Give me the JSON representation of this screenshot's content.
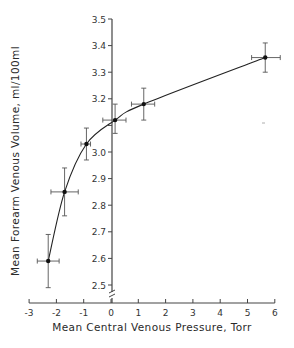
{
  "chart_data": {
    "type": "line",
    "title": "",
    "xlabel": "Mean Central Venous Pressure, Torr",
    "ylabel": "Mean Forearm Venous Volume, ml/100ml",
    "xlim": [
      -3,
      6
    ],
    "ylim": [
      2.45,
      3.5
    ],
    "x_ticks": [
      "-3",
      "-2",
      "-1",
      "0",
      "1",
      "2",
      "3",
      "4",
      "5",
      "6"
    ],
    "y_ticks": [
      "2.5",
      "2.6",
      "2.7",
      "2.8",
      "2.9",
      "3.0",
      "3.1",
      "3.2",
      "3.3",
      "3.4",
      "3.5"
    ],
    "y_tick_labels_shown": [
      "2.5",
      "2.6",
      "2.7",
      "2.8",
      "2.9",
      "3.0",
      "3.2",
      "3.3",
      "3.4",
      "3.5"
    ],
    "grid": false,
    "axis_break": "y-axis break near bottom",
    "series": [
      {
        "name": "Mean forearm venous volume",
        "x": [
          -2.3,
          -1.7,
          -0.9,
          0.15,
          1.2,
          5.65
        ],
        "y": [
          2.59,
          2.85,
          3.03,
          3.12,
          3.18,
          3.355
        ],
        "x_err_low": [
          -2.7,
          -2.2,
          -1.1,
          -0.3,
          0.75,
          5.15
        ],
        "x_err_high": [
          -1.9,
          -1.2,
          -0.75,
          0.55,
          1.6,
          6.2
        ],
        "y_err_low": [
          2.49,
          2.76,
          2.97,
          3.07,
          3.12,
          3.3
        ],
        "y_err_high": [
          2.69,
          2.94,
          3.09,
          3.18,
          3.24,
          3.41
        ]
      }
    ]
  }
}
